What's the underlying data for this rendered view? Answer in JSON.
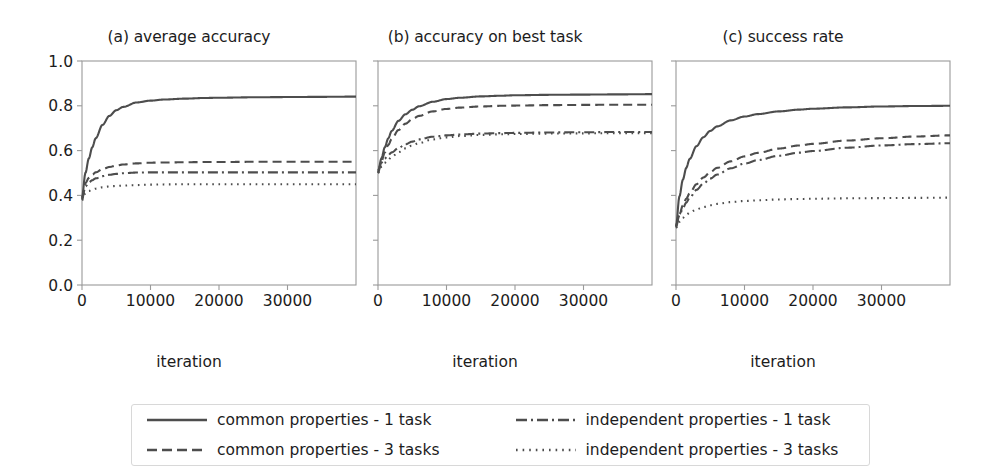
{
  "figure": {
    "background": "#ffffff",
    "line_color": "#4d4d4d",
    "axis_color": "#9a9a9a"
  },
  "axis": {
    "xlabel": "iteration",
    "yticks": [
      "0.0",
      "0.2",
      "0.4",
      "0.6",
      "0.8",
      "1.0"
    ],
    "xticks": [
      "0",
      "10000",
      "20000",
      "30000"
    ],
    "xlim": [
      0,
      40000
    ],
    "ylim": [
      0,
      1
    ]
  },
  "legend": {
    "entries": [
      {
        "label": "common properties - 1 task",
        "style": "solid"
      },
      {
        "label": "common properties - 3 tasks",
        "style": "dashed"
      },
      {
        "label": "independent properties - 1 task",
        "style": "dashdot"
      },
      {
        "label": "independent properties - 3 tasks",
        "style": "dotted"
      }
    ]
  },
  "chart_data": [
    {
      "type": "line",
      "title": "(a) average accuracy",
      "xlabel": "iteration",
      "ylabel": "",
      "xlim": [
        0,
        40000
      ],
      "ylim": [
        0,
        1.0
      ],
      "xticks": [
        0,
        10000,
        20000,
        30000
      ],
      "yticks": [
        0.0,
        0.2,
        0.4,
        0.6,
        0.8,
        1.0
      ],
      "grid": false,
      "legend_position": "below-figure",
      "x": [
        0,
        500,
        1000,
        1500,
        2000,
        3000,
        4000,
        5000,
        6000,
        8000,
        10000,
        12000,
        15000,
        18000,
        20000,
        25000,
        30000,
        35000,
        40000
      ],
      "series": [
        {
          "name": "common properties - 1 task",
          "style": "solid",
          "values": [
            0.39,
            0.5,
            0.565,
            0.615,
            0.655,
            0.715,
            0.755,
            0.78,
            0.795,
            0.815,
            0.823,
            0.828,
            0.832,
            0.835,
            0.836,
            0.838,
            0.839,
            0.84,
            0.841
          ]
        },
        {
          "name": "common properties - 3 tasks",
          "style": "dashed",
          "values": [
            0.385,
            0.455,
            0.478,
            0.492,
            0.503,
            0.517,
            0.527,
            0.533,
            0.538,
            0.543,
            0.546,
            0.547,
            0.548,
            0.549,
            0.549,
            0.55,
            0.55,
            0.55,
            0.55
          ]
        },
        {
          "name": "independent properties - 1 task",
          "style": "dashdot",
          "values": [
            0.382,
            0.44,
            0.458,
            0.468,
            0.476,
            0.486,
            0.492,
            0.496,
            0.499,
            0.502,
            0.503,
            0.503,
            0.503,
            0.503,
            0.503,
            0.503,
            0.503,
            0.503,
            0.503
          ]
        },
        {
          "name": "independent properties - 3 tasks",
          "style": "dotted",
          "values": [
            0.378,
            0.41,
            0.42,
            0.426,
            0.43,
            0.436,
            0.44,
            0.442,
            0.444,
            0.446,
            0.448,
            0.449,
            0.45,
            0.45,
            0.45,
            0.45,
            0.45,
            0.45,
            0.45
          ]
        }
      ]
    },
    {
      "type": "line",
      "title": "(b) accuracy on best task",
      "xlabel": "iteration",
      "ylabel": "",
      "xlim": [
        0,
        40000
      ],
      "ylim": [
        0,
        1.0
      ],
      "xticks": [
        0,
        10000,
        20000,
        30000
      ],
      "yticks": [
        0.0,
        0.2,
        0.4,
        0.6,
        0.8,
        1.0
      ],
      "grid": false,
      "legend_position": "below-figure",
      "x": [
        0,
        500,
        1000,
        1500,
        2000,
        3000,
        4000,
        5000,
        6000,
        8000,
        10000,
        12000,
        15000,
        18000,
        20000,
        25000,
        30000,
        35000,
        40000
      ],
      "series": [
        {
          "name": "common properties - 1 task",
          "style": "solid",
          "values": [
            0.505,
            0.565,
            0.615,
            0.655,
            0.688,
            0.733,
            0.762,
            0.782,
            0.798,
            0.818,
            0.83,
            0.836,
            0.842,
            0.845,
            0.847,
            0.849,
            0.85,
            0.851,
            0.852
          ]
        },
        {
          "name": "common properties - 3 tasks",
          "style": "dashed",
          "values": [
            0.5,
            0.552,
            0.592,
            0.625,
            0.652,
            0.692,
            0.72,
            0.74,
            0.755,
            0.775,
            0.786,
            0.792,
            0.797,
            0.8,
            0.801,
            0.803,
            0.804,
            0.805,
            0.805
          ]
        },
        {
          "name": "independent properties - 1 task",
          "style": "dashdot",
          "values": [
            0.512,
            0.546,
            0.565,
            0.58,
            0.592,
            0.612,
            0.628,
            0.64,
            0.65,
            0.662,
            0.668,
            0.672,
            0.676,
            0.678,
            0.679,
            0.681,
            0.682,
            0.683,
            0.683
          ]
        },
        {
          "name": "independent properties - 3 tasks",
          "style": "dotted",
          "values": [
            0.5,
            0.528,
            0.546,
            0.56,
            0.572,
            0.593,
            0.61,
            0.623,
            0.634,
            0.65,
            0.659,
            0.665,
            0.67,
            0.673,
            0.674,
            0.676,
            0.677,
            0.678,
            0.678
          ]
        }
      ]
    },
    {
      "type": "line",
      "title": "(c) success rate",
      "xlabel": "iteration",
      "ylabel": "",
      "xlim": [
        0,
        40000
      ],
      "ylim": [
        0,
        1.0
      ],
      "xticks": [
        0,
        10000,
        20000,
        30000
      ],
      "yticks": [
        0.0,
        0.2,
        0.4,
        0.6,
        0.8,
        1.0
      ],
      "grid": false,
      "legend_position": "below-figure",
      "x": [
        0,
        500,
        1000,
        1500,
        2000,
        3000,
        4000,
        5000,
        6000,
        8000,
        10000,
        12000,
        15000,
        18000,
        20000,
        25000,
        30000,
        35000,
        40000
      ],
      "series": [
        {
          "name": "common properties - 1 task",
          "style": "solid",
          "values": [
            0.262,
            0.395,
            0.47,
            0.523,
            0.563,
            0.62,
            0.66,
            0.688,
            0.708,
            0.735,
            0.752,
            0.763,
            0.775,
            0.783,
            0.787,
            0.793,
            0.797,
            0.799,
            0.8
          ]
        },
        {
          "name": "common properties - 3 tasks",
          "style": "dashed",
          "values": [
            0.258,
            0.315,
            0.355,
            0.385,
            0.41,
            0.45,
            0.48,
            0.504,
            0.523,
            0.552,
            0.574,
            0.59,
            0.609,
            0.623,
            0.63,
            0.645,
            0.655,
            0.663,
            0.668
          ]
        },
        {
          "name": "independent properties - 1 task",
          "style": "dashdot",
          "values": [
            0.268,
            0.31,
            0.342,
            0.368,
            0.39,
            0.425,
            0.453,
            0.475,
            0.493,
            0.521,
            0.542,
            0.558,
            0.577,
            0.591,
            0.598,
            0.613,
            0.623,
            0.629,
            0.633
          ]
        },
        {
          "name": "independent properties - 3 tasks",
          "style": "dotted",
          "values": [
            0.255,
            0.282,
            0.3,
            0.313,
            0.323,
            0.338,
            0.348,
            0.356,
            0.362,
            0.37,
            0.375,
            0.378,
            0.382,
            0.384,
            0.385,
            0.387,
            0.388,
            0.389,
            0.39
          ]
        }
      ]
    }
  ]
}
